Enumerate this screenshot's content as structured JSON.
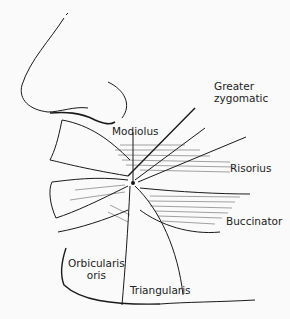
{
  "diagram": {
    "labels": {
      "greater_zygomatic_1": "Greater",
      "greater_zygomatic_2": "zygomatic",
      "modiolus": "Modiolus",
      "risorius": "Risorius",
      "buccinator": "Buccinator",
      "orbicularis_1": "Orbicularis",
      "orbicularis_2": "oris",
      "triangularis": "Triangularis"
    },
    "colors": {
      "ink": "#1a1a1a",
      "background": "#fafafa"
    }
  }
}
